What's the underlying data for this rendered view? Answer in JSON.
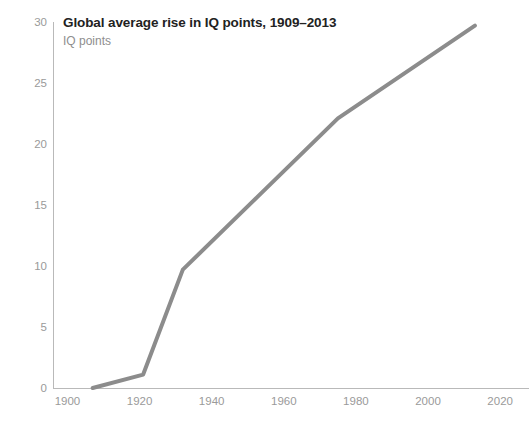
{
  "chart_data": {
    "type": "line",
    "title": "Global average rise in IQ points, 1909–2013",
    "subtitle": "IQ points",
    "xlabel": "",
    "ylabel": "IQ points",
    "xlim": [
      1896,
      2028
    ],
    "ylim": [
      0,
      30
    ],
    "grid": false,
    "legend": false,
    "x_ticks": [
      1900,
      1920,
      1940,
      1960,
      1980,
      2000,
      2020
    ],
    "x_tick_labels": [
      "1900",
      "1920",
      "1940",
      "1960",
      "1980",
      "2000",
      "2020"
    ],
    "y_ticks": [
      0,
      5,
      10,
      15,
      20,
      25,
      30
    ],
    "y_tick_labels": [
      "0",
      "5",
      "10",
      "15",
      "20",
      "25",
      "30"
    ],
    "series": [
      {
        "name": "Global average rise in IQ points",
        "color": "#8c8c8c",
        "stroke_width": 4,
        "x": [
          1907,
          1921,
          1932,
          1975,
          2013
        ],
        "values": [
          0.0,
          1.1,
          9.7,
          22.1,
          29.7
        ]
      }
    ]
  },
  "axes": {
    "y_axis_color": "#b9b9b9",
    "x_axis_color": "#b9b9b9",
    "tick_label_color": "#9a9a9a"
  },
  "style": {
    "background": "#ffffff",
    "title_color": "#222222",
    "subtitle_color": "#8e8e8e",
    "line_color": "#8c8c8c"
  }
}
